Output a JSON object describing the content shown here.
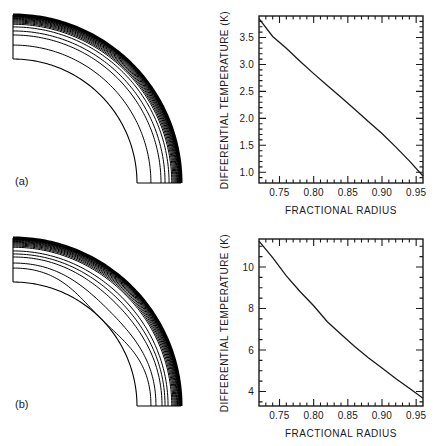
{
  "panels": [
    {
      "label": "(a)"
    },
    {
      "label": "(b)"
    }
  ],
  "colors": {
    "line": "#1a1a1a",
    "text": "#1a1a1a",
    "background": "#ffffff"
  },
  "chart_data": [
    {
      "id": "temperature-profile-a",
      "panel": "a",
      "type": "line",
      "title": "",
      "xlabel": "FRACTIONAL RADIUS",
      "ylabel": "DIFFERENTIAL TEMPERATURE (K)",
      "xlim": [
        0.72,
        0.96
      ],
      "ylim": [
        0.8,
        3.9
      ],
      "xticks": [
        0.75,
        0.8,
        0.85,
        0.9,
        0.95
      ],
      "yticks": [
        1.0,
        1.5,
        2.0,
        2.5,
        3.0,
        3.5
      ],
      "x_minor_step": 0.01,
      "y_minor_step": 0.1,
      "x_tick_decimals": 2,
      "y_tick_decimals": 1,
      "grid": false,
      "legend": "none",
      "x": [
        0.72,
        0.74,
        0.76,
        0.78,
        0.8,
        0.82,
        0.84,
        0.86,
        0.88,
        0.9,
        0.92,
        0.94,
        0.96
      ],
      "y": [
        3.85,
        3.52,
        3.3,
        3.06,
        2.83,
        2.61,
        2.39,
        2.17,
        1.94,
        1.72,
        1.47,
        1.21,
        0.93
      ]
    },
    {
      "id": "temperature-profile-b",
      "panel": "b",
      "type": "line",
      "title": "",
      "xlabel": "FRACTIONAL RADIUS",
      "ylabel": "DIFFERENTIAL TEMPERATURE (K)",
      "xlim": [
        0.72,
        0.96
      ],
      "ylim": [
        3.3,
        11.35
      ],
      "xticks": [
        0.75,
        0.8,
        0.85,
        0.9,
        0.95
      ],
      "yticks": [
        4,
        6,
        8,
        10
      ],
      "x_minor_step": 0.01,
      "y_minor_step": 0.5,
      "x_tick_decimals": 2,
      "y_tick_decimals": 0,
      "grid": false,
      "legend": "none",
      "x": [
        0.72,
        0.74,
        0.76,
        0.78,
        0.8,
        0.82,
        0.84,
        0.86,
        0.88,
        0.9,
        0.92,
        0.94,
        0.96
      ],
      "y": [
        11.25,
        10.45,
        9.57,
        8.82,
        8.13,
        7.36,
        6.76,
        6.17,
        5.63,
        5.13,
        4.63,
        4.16,
        3.67
      ]
    },
    {
      "id": "contour-map-a",
      "panel": "a",
      "type": "contour-quarter-annulus",
      "description": "Concentric temperature contours in a quarter annulus, bunched toward the outer radius",
      "inner_fraction": 0.738,
      "dip_power": 3,
      "levels": [
        {
          "f": 0.821,
          "a": 0
        },
        {
          "f": 0.881,
          "a": 0
        },
        {
          "f": 0.905,
          "a": 0
        },
        {
          "f": 0.929,
          "a": 0
        },
        {
          "f": 0.945,
          "a": 0
        },
        {
          "f": 0.952,
          "a": 0
        },
        {
          "f": 0.9585,
          "a": 0
        },
        {
          "f": 0.9645,
          "a": 0
        },
        {
          "f": 0.97,
          "a": 0
        },
        {
          "f": 0.975,
          "a": 0
        },
        {
          "f": 0.9795,
          "a": 0
        },
        {
          "f": 0.9835,
          "a": 0
        },
        {
          "f": 0.987,
          "a": 0
        },
        {
          "f": 0.99,
          "a": 0
        },
        {
          "f": 0.9925,
          "a": 0
        },
        {
          "f": 0.9945,
          "a": 0
        },
        {
          "f": 0.9965,
          "a": 0
        },
        {
          "f": 0.998,
          "a": 0
        }
      ]
    },
    {
      "id": "contour-map-b",
      "panel": "b",
      "type": "contour-quarter-annulus",
      "description": "Temperature contours in a quarter annulus with mid-level contours dipping toward the inner boundary at 45 degrees",
      "inner_fraction": 0.738,
      "dip_power": 3,
      "levels": [
        {
          "f": 0.821,
          "a": 0.083
        },
        {
          "f": 0.851,
          "a": 0.045
        },
        {
          "f": 0.887,
          "a": 0.022
        },
        {
          "f": 0.905,
          "a": 0.013
        },
        {
          "f": 0.923,
          "a": 0.007
        },
        {
          "f": 0.945,
          "a": 0.003
        },
        {
          "f": 0.952,
          "a": 0.0025
        },
        {
          "f": 0.9585,
          "a": 0.002
        },
        {
          "f": 0.9645,
          "a": 0.0015
        },
        {
          "f": 0.97,
          "a": 0.001
        },
        {
          "f": 0.975,
          "a": 0.001
        },
        {
          "f": 0.9795,
          "a": 0.0008
        },
        {
          "f": 0.9835,
          "a": 0.0006
        },
        {
          "f": 0.987,
          "a": 0.0005
        },
        {
          "f": 0.99,
          "a": 0.0004
        },
        {
          "f": 0.9925,
          "a": 0.0003
        },
        {
          "f": 0.9945,
          "a": 0.0002
        },
        {
          "f": 0.9965,
          "a": 0.0001
        },
        {
          "f": 0.998,
          "a": 0
        }
      ]
    }
  ]
}
